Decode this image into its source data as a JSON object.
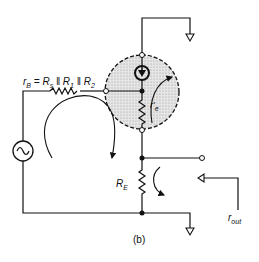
{
  "diagram": {
    "type": "small-signal equivalent circuit",
    "caption": "(b)",
    "labels": {
      "rb_equation_r": "r",
      "rb_equation_sub": "B",
      "rb_equation_rest": " = R",
      "rb_rs_sub": "s",
      "rb_par1": " ‖ R",
      "rb_r1_sub": "1",
      "rb_par2": " ‖ R",
      "rb_r2_sub": "2",
      "re_prime": "r′",
      "re_prime_sub": "e",
      "RE": "R",
      "RE_sub": "E",
      "rout": "r",
      "rout_sub": "out"
    },
    "components": [
      {
        "name": "ac-source",
        "symbol": "sine"
      },
      {
        "name": "base-resistance",
        "label": "rB = Rs || R1 || R2"
      },
      {
        "name": "transistor-model",
        "contains": [
          "current-source",
          "r'e"
        ]
      },
      {
        "name": "emitter-resistor",
        "label": "RE"
      },
      {
        "name": "output-terminal"
      },
      {
        "name": "ground",
        "count": 2
      }
    ],
    "colors": {
      "ink": "#111111",
      "shade": "#d8d8d8"
    }
  }
}
